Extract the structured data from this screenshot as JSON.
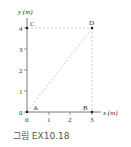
{
  "axes": {
    "y_label": "y (m)",
    "x_label": "x (m)",
    "y_ticks": [
      "0",
      "1",
      "2",
      "3",
      "4"
    ],
    "x_ticks": [
      "0",
      "1",
      "2",
      "3"
    ]
  },
  "points": {
    "A": {
      "label": "A",
      "x": 0,
      "y": 0
    },
    "B": {
      "label": "B",
      "x": 3,
      "y": 0
    },
    "C": {
      "label": "C",
      "x": 0,
      "y": 4
    },
    "D": {
      "label": "D",
      "x": 3,
      "y": 4
    }
  },
  "caption": "그림 EX10.18",
  "colors": {
    "axis": "#555555",
    "dashed": "#bbbbbb",
    "point": "#222222"
  }
}
